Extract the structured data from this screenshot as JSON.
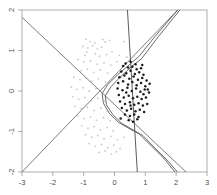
{
  "chart_data": {
    "type": "scatter",
    "title": "",
    "subtitle": "",
    "xlabel": "",
    "ylabel": "",
    "xlim": [
      -3,
      3
    ],
    "ylim": [
      -2,
      2
    ],
    "xticks": [
      -3,
      -2,
      -1,
      0,
      1,
      2,
      3
    ],
    "yticks": [
      -2,
      -1,
      0,
      1,
      2
    ],
    "xtick_labels": [
      "-3",
      "-2",
      "-1",
      "0",
      "1",
      "2",
      "3"
    ],
    "ytick_labels": [
      "-2",
      "-1",
      "0",
      "1",
      "2"
    ],
    "grid": false,
    "legend": null,
    "frame": true,
    "series": [
      {
        "name": "class-0-light",
        "color": "#b9b9b9",
        "marker": "dot",
        "points": [
          [
            -0.92,
            1.28
          ],
          [
            -0.8,
            1.22
          ],
          [
            -0.64,
            1.19
          ],
          [
            -0.38,
            1.27
          ],
          [
            -0.3,
            1.21
          ],
          [
            -0.16,
            1.25
          ],
          [
            0.3,
            1.22
          ],
          [
            -1.02,
            1.1
          ],
          [
            -0.86,
            1.06
          ],
          [
            -0.71,
            1.12
          ],
          [
            -0.55,
            1.04
          ],
          [
            -0.42,
            1.08
          ],
          [
            -0.9,
            0.96
          ],
          [
            -0.96,
            0.88
          ],
          [
            -0.62,
            0.92
          ],
          [
            -0.48,
            0.86
          ],
          [
            -0.26,
            0.9
          ],
          [
            -0.08,
            0.96
          ],
          [
            0.16,
            0.88
          ],
          [
            0.4,
            0.84
          ],
          [
            -1.18,
            0.78
          ],
          [
            -1.0,
            0.72
          ],
          [
            -0.78,
            0.74
          ],
          [
            -0.56,
            0.66
          ],
          [
            -0.34,
            0.7
          ],
          [
            -0.12,
            0.64
          ],
          [
            0.08,
            0.72
          ],
          [
            -1.26,
            0.56
          ],
          [
            -1.08,
            0.5
          ],
          [
            -0.88,
            0.54
          ],
          [
            -0.68,
            0.46
          ],
          [
            -0.46,
            0.52
          ],
          [
            -0.22,
            0.44
          ],
          [
            -1.32,
            0.34
          ],
          [
            -1.12,
            0.28
          ],
          [
            -0.94,
            0.32
          ],
          [
            -0.74,
            0.24
          ],
          [
            -0.52,
            0.3
          ],
          [
            -0.3,
            0.22
          ],
          [
            -0.1,
            0.28
          ],
          [
            -1.4,
            0.1
          ],
          [
            -1.22,
            0.04
          ],
          [
            -1.02,
            0.08
          ],
          [
            -0.82,
            0.0
          ],
          [
            -0.6,
            0.06
          ],
          [
            -0.38,
            -0.02
          ],
          [
            -1.36,
            -0.14
          ],
          [
            -1.16,
            -0.2
          ],
          [
            -0.96,
            -0.16
          ],
          [
            -0.76,
            -0.24
          ],
          [
            -0.54,
            -0.18
          ],
          [
            -0.32,
            -0.26
          ],
          [
            -1.28,
            -0.38
          ],
          [
            -1.08,
            -0.44
          ],
          [
            -0.88,
            -0.4
          ],
          [
            -0.66,
            -0.48
          ],
          [
            -0.44,
            -0.42
          ],
          [
            -0.24,
            -0.5
          ],
          [
            -1.18,
            -0.62
          ],
          [
            -0.98,
            -0.68
          ],
          [
            -0.78,
            -0.64
          ],
          [
            -0.58,
            -0.72
          ],
          [
            -0.36,
            -0.66
          ],
          [
            -0.14,
            -0.74
          ],
          [
            -1.06,
            -0.86
          ],
          [
            -0.86,
            -0.92
          ],
          [
            -0.66,
            -0.88
          ],
          [
            -0.46,
            -0.96
          ],
          [
            -0.24,
            -0.9
          ],
          [
            -0.04,
            -0.98
          ],
          [
            -0.94,
            -1.08
          ],
          [
            -0.74,
            -1.14
          ],
          [
            -0.54,
            -1.1
          ],
          [
            -0.34,
            -1.18
          ],
          [
            -0.12,
            -1.12
          ],
          [
            0.1,
            -1.2
          ],
          [
            0.3,
            -1.14
          ],
          [
            -0.82,
            -1.3
          ],
          [
            -0.62,
            -1.36
          ],
          [
            -0.42,
            -1.32
          ],
          [
            -0.22,
            -1.4
          ],
          [
            -0.02,
            -1.34
          ],
          [
            0.18,
            -1.42
          ],
          [
            -0.5,
            -1.52
          ],
          [
            -0.3,
            -1.48
          ],
          [
            -0.1,
            -1.56
          ],
          [
            0.06,
            -1.5
          ]
        ]
      },
      {
        "name": "class-1-dark",
        "color": "#111111",
        "marker": "dot",
        "points": [
          [
            0.28,
            0.62
          ],
          [
            0.44,
            0.58
          ],
          [
            0.58,
            0.6
          ],
          [
            0.72,
            0.54
          ],
          [
            0.86,
            0.56
          ],
          [
            0.22,
            0.48
          ],
          [
            0.38,
            0.44
          ],
          [
            0.52,
            0.5
          ],
          [
            0.66,
            0.42
          ],
          [
            0.8,
            0.46
          ],
          [
            0.94,
            0.4
          ],
          [
            0.16,
            0.34
          ],
          [
            0.32,
            0.38
          ],
          [
            0.48,
            0.3
          ],
          [
            0.62,
            0.36
          ],
          [
            0.76,
            0.28
          ],
          [
            0.9,
            0.32
          ],
          [
            1.04,
            0.26
          ],
          [
            0.12,
            0.2
          ],
          [
            0.28,
            0.24
          ],
          [
            0.44,
            0.16
          ],
          [
            0.58,
            0.22
          ],
          [
            0.72,
            0.14
          ],
          [
            0.86,
            0.2
          ],
          [
            1.0,
            0.12
          ],
          [
            1.14,
            0.18
          ],
          [
            0.1,
            0.06
          ],
          [
            0.26,
            0.02
          ],
          [
            0.42,
            0.08
          ],
          [
            0.56,
            0.0
          ],
          [
            0.7,
            0.06
          ],
          [
            0.84,
            -0.02
          ],
          [
            0.98,
            0.04
          ],
          [
            1.12,
            -0.04
          ],
          [
            0.14,
            -0.1
          ],
          [
            0.3,
            -0.16
          ],
          [
            0.46,
            -0.12
          ],
          [
            0.6,
            -0.18
          ],
          [
            0.74,
            -0.14
          ],
          [
            0.88,
            -0.2
          ],
          [
            1.02,
            -0.16
          ],
          [
            0.18,
            -0.26
          ],
          [
            0.34,
            -0.32
          ],
          [
            0.5,
            -0.28
          ],
          [
            0.64,
            -0.34
          ],
          [
            0.78,
            -0.3
          ],
          [
            0.92,
            -0.36
          ],
          [
            1.06,
            -0.32
          ],
          [
            0.24,
            -0.42
          ],
          [
            0.4,
            -0.48
          ],
          [
            0.54,
            -0.44
          ],
          [
            0.68,
            -0.5
          ],
          [
            0.82,
            -0.46
          ],
          [
            0.96,
            -0.52
          ],
          [
            0.34,
            -0.58
          ],
          [
            0.5,
            -0.62
          ],
          [
            0.64,
            -0.58
          ],
          [
            0.78,
            -0.64
          ],
          [
            0.46,
            -0.72
          ],
          [
            0.6,
            -0.76
          ],
          [
            0.74,
            -0.7
          ],
          [
            0.36,
            0.68
          ],
          [
            0.52,
            0.72
          ],
          [
            0.68,
            0.66
          ],
          [
            0.2,
            -0.68
          ],
          [
            0.9,
            0.64
          ],
          [
            1.08,
            0.04
          ],
          [
            0.94,
            -0.08
          ],
          [
            0.38,
            -0.04
          ],
          [
            0.52,
            -0.36
          ]
        ]
      }
    ],
    "boundaries": [
      {
        "name": "linear-descending",
        "kind": "line",
        "color": "#6e6e6e",
        "from": [
          -3.0,
          1.82
        ],
        "to": [
          2.32,
          -2.0
        ]
      },
      {
        "name": "linear-ascending",
        "kind": "line",
        "color": "#6e6e6e",
        "from": [
          -3.0,
          -2.0
        ],
        "to": [
          2.05,
          2.0
        ]
      },
      {
        "name": "steep-vertical",
        "kind": "line",
        "color": "#4a4a4a",
        "from": [
          0.42,
          2.0
        ],
        "to": [
          0.74,
          -2.0
        ]
      },
      {
        "name": "curved-envelope",
        "kind": "curve",
        "color": "#5a5a5a",
        "points": [
          [
            2.05,
            2.0
          ],
          [
            1.35,
            1.38
          ],
          [
            0.8,
            0.86
          ],
          [
            0.44,
            0.62
          ],
          [
            0.1,
            0.4
          ],
          [
            -0.22,
            0.16
          ],
          [
            -0.4,
            -0.06
          ],
          [
            -0.36,
            -0.3
          ],
          [
            -0.16,
            -0.56
          ],
          [
            0.14,
            -0.78
          ],
          [
            0.46,
            -0.92
          ],
          [
            0.8,
            -1.06
          ],
          [
            1.2,
            -1.36
          ],
          [
            1.6,
            -1.66
          ],
          [
            1.96,
            -2.0
          ]
        ]
      },
      {
        "name": "curved-envelope-inner",
        "kind": "curve",
        "color": "#5a5a5a",
        "points": [
          [
            2.12,
            2.0
          ],
          [
            1.42,
            1.34
          ],
          [
            0.88,
            0.8
          ],
          [
            0.52,
            0.58
          ],
          [
            0.18,
            0.34
          ],
          [
            -0.12,
            0.1
          ],
          [
            -0.3,
            -0.12
          ],
          [
            -0.26,
            -0.34
          ],
          [
            -0.06,
            -0.58
          ],
          [
            0.24,
            -0.8
          ],
          [
            0.56,
            -0.94
          ],
          [
            0.92,
            -1.1
          ],
          [
            1.3,
            -1.4
          ],
          [
            1.7,
            -1.7
          ],
          [
            2.04,
            -2.0
          ]
        ]
      }
    ]
  },
  "axes": {
    "x_tick_labels": [
      "-3",
      "-2",
      "-1",
      "0",
      "1",
      "2",
      "3"
    ],
    "y_tick_labels": [
      "-2",
      "-1",
      "0",
      "1",
      "2"
    ]
  }
}
